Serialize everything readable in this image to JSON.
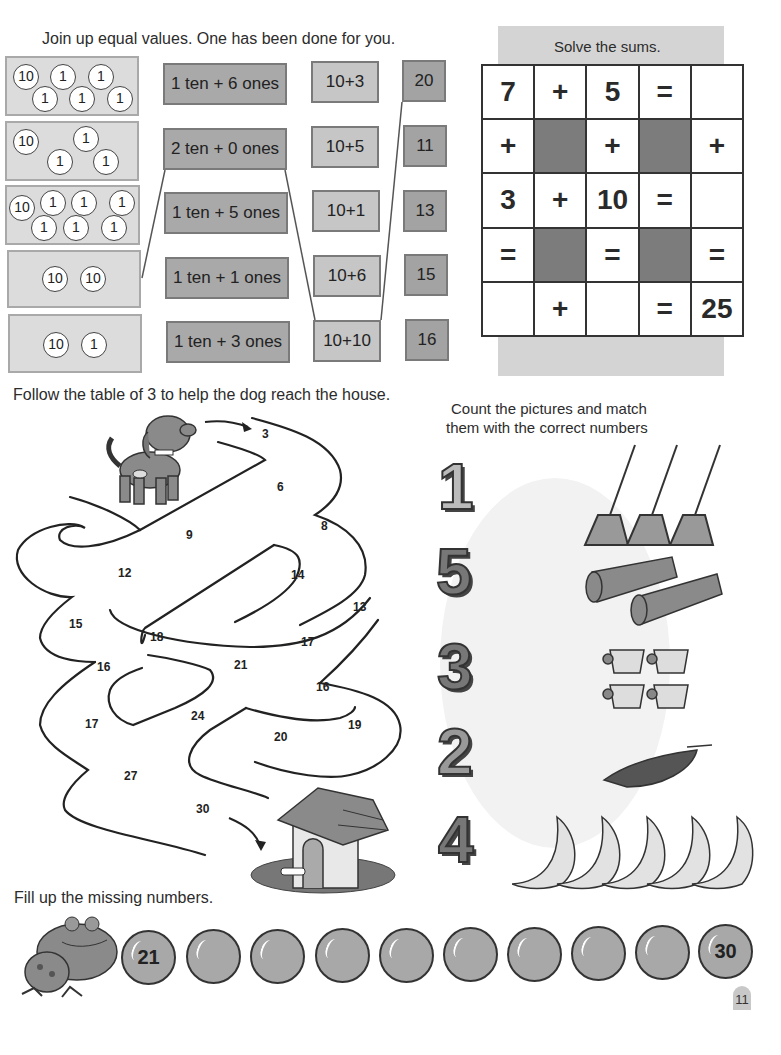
{
  "join_section": {
    "instruction": "Join up equal values. One has been done for you.",
    "coin_groups": [
      {
        "coins": [
          "10",
          "1",
          "1",
          "1",
          "1",
          "1"
        ]
      },
      {
        "coins": [
          "10",
          "1",
          "1",
          "1"
        ]
      },
      {
        "coins": [
          "10",
          "1",
          "1",
          "1",
          "1",
          "1",
          "1"
        ]
      },
      {
        "coins": [
          "10",
          "10"
        ]
      },
      {
        "coins": [
          "10",
          "1"
        ]
      }
    ],
    "word_boxes": [
      "1 ten + 6 ones",
      "2 ten + 0 ones",
      "1 ten + 5 ones",
      "1 ten + 1 ones",
      "1 ten + 3 ones"
    ],
    "sum_boxes": [
      "10+3",
      "10+5",
      "10+1",
      "10+6",
      "10+10"
    ],
    "number_boxes": [
      "20",
      "11",
      "13",
      "15",
      "16"
    ]
  },
  "sums_section": {
    "title": "Solve the sums.",
    "grid": [
      [
        "7",
        "+",
        "5",
        "=",
        ""
      ],
      [
        "+",
        "#",
        "+",
        "#",
        "+"
      ],
      [
        "3",
        "+",
        "10",
        "=",
        ""
      ],
      [
        "=",
        "#",
        "=",
        "#",
        "="
      ],
      [
        "",
        "+",
        "",
        "=",
        "25"
      ]
    ]
  },
  "maze_section": {
    "instruction": "Follow the table of 3 to help the dog reach the house.",
    "numbers": [
      {
        "v": "3",
        "x": 262,
        "y": 427
      },
      {
        "v": "6",
        "x": 277,
        "y": 480
      },
      {
        "v": "8",
        "x": 321,
        "y": 519
      },
      {
        "v": "9",
        "x": 186,
        "y": 528
      },
      {
        "v": "12",
        "x": 118,
        "y": 566
      },
      {
        "v": "14",
        "x": 291,
        "y": 568
      },
      {
        "v": "13",
        "x": 353,
        "y": 600
      },
      {
        "v": "15",
        "x": 69,
        "y": 617
      },
      {
        "v": "18",
        "x": 150,
        "y": 630
      },
      {
        "v": "17",
        "x": 301,
        "y": 635
      },
      {
        "v": "16",
        "x": 97,
        "y": 660
      },
      {
        "v": "21",
        "x": 234,
        "y": 658
      },
      {
        "v": "16",
        "x": 316,
        "y": 680
      },
      {
        "v": "17",
        "x": 85,
        "y": 717
      },
      {
        "v": "24",
        "x": 191,
        "y": 709
      },
      {
        "v": "19",
        "x": 348,
        "y": 718
      },
      {
        "v": "20",
        "x": 274,
        "y": 730
      },
      {
        "v": "27",
        "x": 124,
        "y": 769
      },
      {
        "v": "30",
        "x": 196,
        "y": 802
      }
    ]
  },
  "count_section": {
    "instruction_line1": "Count the pictures and match",
    "instruction_line2": "them with the correct numbers",
    "numbers": [
      "1",
      "5",
      "3",
      "2",
      "4"
    ],
    "pictures": [
      {
        "item": "mop",
        "count": 3
      },
      {
        "item": "log",
        "count": 2
      },
      {
        "item": "cup",
        "count": 4
      },
      {
        "item": "pea-pod",
        "count": 1
      },
      {
        "item": "moon",
        "count": 5
      }
    ]
  },
  "fill_section": {
    "instruction": "Fill up the missing numbers.",
    "bubbles": [
      "21",
      "",
      "",
      "",
      "",
      "",
      "",
      "",
      "",
      "30"
    ]
  },
  "page_number": "11"
}
